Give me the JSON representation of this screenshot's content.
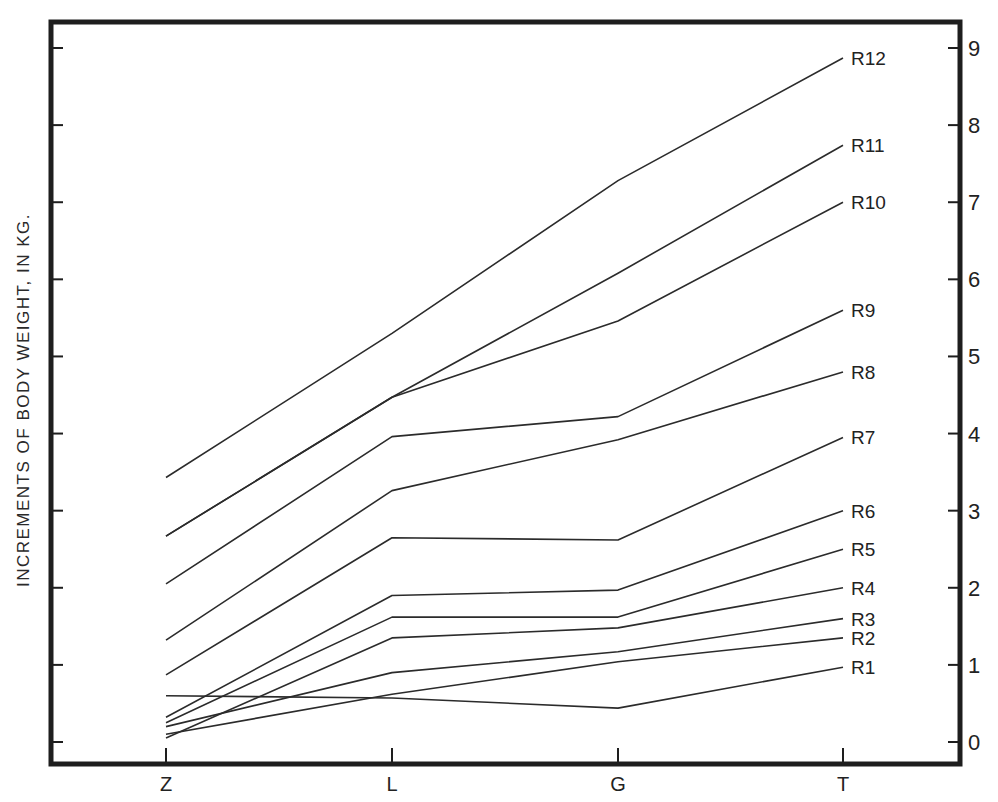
{
  "chart_data": {
    "type": "line",
    "title": "",
    "xlabel": "",
    "ylabel": "INCREMENTS OF BODY WEIGHT, IN KG.",
    "categories": [
      "Z",
      "L",
      "G",
      "T"
    ],
    "ylim": [
      0,
      9
    ],
    "yticks_right": [
      "0",
      "1",
      "2",
      "3",
      "4",
      "5",
      "6",
      "7",
      "8",
      "9"
    ],
    "grid": false,
    "legend_position": "inline labels at right end of each line",
    "series": [
      {
        "name": "R1",
        "values": [
          0.6,
          0.57,
          0.44,
          0.97
        ]
      },
      {
        "name": "R2",
        "values": [
          0.1,
          0.62,
          1.04,
          1.35
        ]
      },
      {
        "name": "R3",
        "values": [
          0.2,
          0.9,
          1.17,
          1.6
        ]
      },
      {
        "name": "R4",
        "values": [
          0.05,
          1.35,
          1.48,
          2.0
        ]
      },
      {
        "name": "R5",
        "values": [
          0.25,
          1.62,
          1.62,
          2.5
        ]
      },
      {
        "name": "R6",
        "values": [
          0.32,
          1.9,
          1.97,
          3.0
        ]
      },
      {
        "name": "R7",
        "values": [
          0.87,
          2.65,
          2.62,
          3.95
        ]
      },
      {
        "name": "R8",
        "values": [
          1.32,
          3.26,
          3.92,
          4.8
        ]
      },
      {
        "name": "R9",
        "values": [
          2.05,
          3.96,
          4.22,
          5.6
        ]
      },
      {
        "name": "R10",
        "values": [
          2.67,
          4.47,
          5.46,
          7.0
        ]
      },
      {
        "name": "R11",
        "values": [
          2.67,
          4.47,
          6.08,
          7.74
        ]
      },
      {
        "name": "R12",
        "values": [
          3.43,
          5.3,
          7.28,
          8.87
        ]
      }
    ]
  },
  "axis": {
    "ylabel": "INCREMENTS OF BODY WEIGHT, IN KG."
  },
  "colors": {
    "line": "#2b2b2b",
    "frame": "#1e1e1e",
    "background": "#ffffff"
  }
}
